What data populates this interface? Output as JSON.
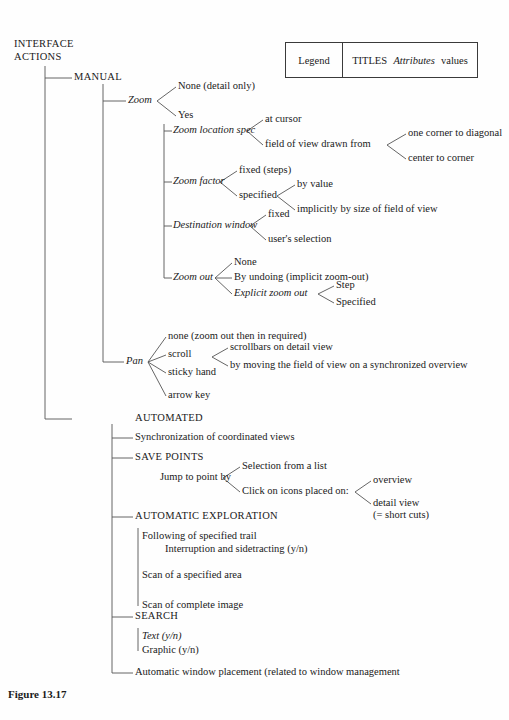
{
  "figure": {
    "caption": "Figure 13.17"
  },
  "legend": {
    "label": "Legend",
    "titles": "TITLES",
    "attributes": "Attributes",
    "values": "values"
  },
  "root": {
    "line1": "INTERFACE",
    "line2": "ACTIONS"
  },
  "nodes": {
    "manual": "MANUAL",
    "zoom": "Zoom",
    "zoom_none": "None (detail only)",
    "zoom_yes": "Yes",
    "zoom_location_spec": "Zoom location spec",
    "at_cursor": "at cursor",
    "fov_drawn_from": "field of view drawn from",
    "one_corner_to_diagonal": "one corner to diagonal",
    "center_to_corner": "center to corner",
    "zoom_factor": "Zoom factor",
    "fixed_steps": "fixed (steps)",
    "specified": "specified",
    "by_value": "by value",
    "implicitly_by_size": "implicitly by size of field of view",
    "destination_window": "Destination window",
    "dest_fixed": "fixed",
    "dest_user_selection": "user's selection",
    "zoom_out": "Zoom out",
    "zo_none": "None",
    "zo_by_undoing": "By undoing (implicit zoom-out)",
    "zo_explicit": "Explicit zoom out",
    "zo_step": "Step",
    "zo_specified": "Specified",
    "pan": "Pan",
    "pan_none": "none (zoom out then in required)",
    "pan_scroll": "scroll",
    "pan_scrollbars": "scrollbars on detail view",
    "pan_by_moving": "by moving the field of view on a synchronized overview",
    "pan_sticky_hand": "sticky hand",
    "pan_arrow_key": "arrow key",
    "automated": "AUTOMATED",
    "sync_coordinated": "Synchronization of coordinated views",
    "save_points": "SAVE POINTS",
    "jump_to_point_by": "Jump to point by",
    "selection_from_list": "Selection from a list",
    "click_on_icons": "Click on icons placed on:",
    "overview": "overview",
    "detail_view": "detail view",
    "short_cuts": "(= short cuts)",
    "automatic_exploration": "AUTOMATIC EXPLORATION",
    "following_trail": "Following of specified trail",
    "interruption": "Interruption and sidetracting (y/n)",
    "scan_specified_area": "Scan of a specified area",
    "scan_complete_image": "Scan of complete image",
    "search": "SEARCH",
    "search_text": "Text (y/n)",
    "search_graphic": "Graphic (y/n)",
    "auto_window_placement": "Automatic window placement (related to window management"
  },
  "colors": {
    "line": "#555555",
    "text": "#1a1a1a",
    "background": "#fefefe",
    "legend_border": "#3a3a3a"
  }
}
